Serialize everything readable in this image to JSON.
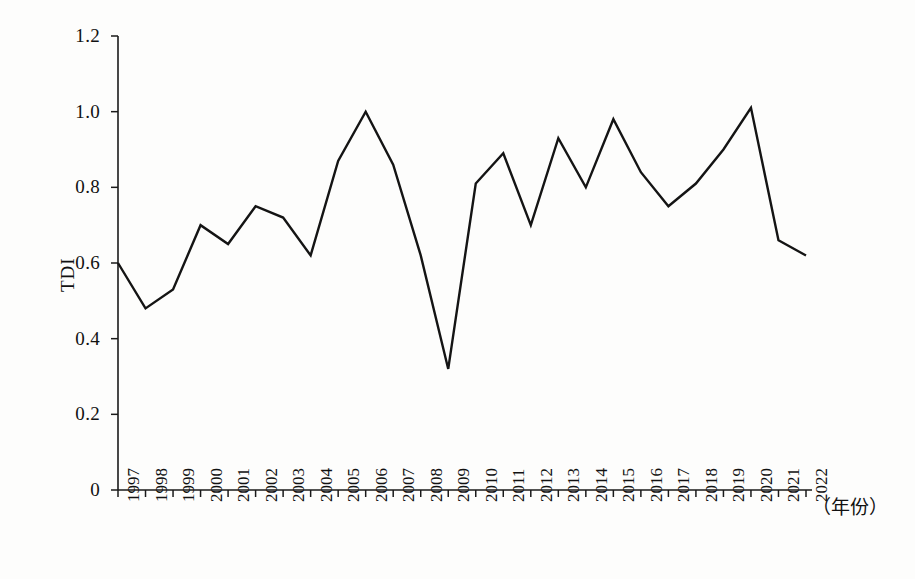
{
  "chart_data": {
    "type": "line",
    "title": "",
    "xlabel": "（年份）",
    "ylabel": "TDI",
    "categories": [
      "1997",
      "1998",
      "1999",
      "2000",
      "2001",
      "2002",
      "2003",
      "2004",
      "2005",
      "2006",
      "2007",
      "2008",
      "2009",
      "2010",
      "2011",
      "2012",
      "2013",
      "2014",
      "2015",
      "2016",
      "2017",
      "2018",
      "2019",
      "2020",
      "2021",
      "2022"
    ],
    "values": [
      0.6,
      0.48,
      0.53,
      0.7,
      0.65,
      0.75,
      0.72,
      0.62,
      0.87,
      1.0,
      0.86,
      0.62,
      0.32,
      0.81,
      0.89,
      0.7,
      0.93,
      0.8,
      0.98,
      0.84,
      0.75,
      0.81,
      0.9,
      1.01,
      0.66,
      0.62
    ],
    "series": [
      {
        "name": "TDI",
        "color": "#141414",
        "values": [
          0.6,
          0.48,
          0.53,
          0.7,
          0.65,
          0.75,
          0.72,
          0.62,
          0.87,
          1.0,
          0.86,
          0.62,
          0.32,
          0.81,
          0.89,
          0.7,
          0.93,
          0.8,
          0.98,
          0.84,
          0.75,
          0.81,
          0.9,
          1.01,
          0.66,
          0.62
        ]
      }
    ],
    "ylim": [
      0,
      1.2
    ],
    "yticks": [
      "0",
      "0.2",
      "0.4",
      "0.6",
      "0.8",
      "1.0",
      "1.2"
    ],
    "ytick_values": [
      0,
      0.2,
      0.4,
      0.6,
      0.8,
      1.0,
      1.2
    ],
    "grid": false,
    "legend": false,
    "legend_position": "none",
    "markers": false,
    "line_color": "#141414",
    "line_width": 2.4,
    "axis_color": "#1a1a1a"
  },
  "axes": {
    "y_title": "TDI",
    "x_title": "（年份）"
  }
}
